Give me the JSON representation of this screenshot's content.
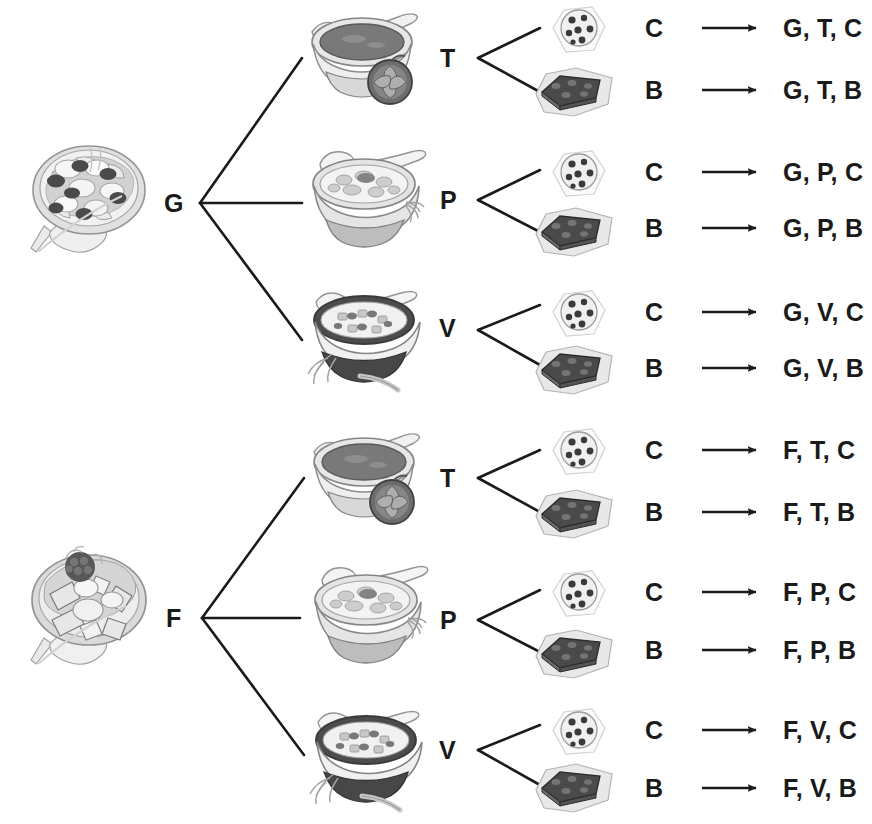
{
  "diagram": {
    "type": "tree-diagram",
    "levels": [
      "salad",
      "soup",
      "dessert",
      "outcome"
    ],
    "stage_width": 872,
    "stage_height": 824,
    "line_color": "#1a1a1a",
    "text_color": "#1a1a1a",
    "background": "#ffffff"
  },
  "legend": {
    "salad_codes": {
      "G": "Garden salad",
      "F": "Fruit salad"
    },
    "soup_codes": {
      "T": "Tomato soup",
      "P": "Potato soup",
      "V": "Vegetable soup"
    },
    "dessert_codes": {
      "C": "Cookie",
      "B": "Brownie"
    }
  },
  "branches": [
    {
      "root_label": "G",
      "root_image": "garden-salad-plate",
      "soups": [
        {
          "label": "T",
          "image": "tomato-soup-bowl",
          "desserts": [
            {
              "label": "C",
              "image": "cookie",
              "outcome": "G, T, C"
            },
            {
              "label": "B",
              "image": "brownie",
              "outcome": "G, T, B"
            }
          ]
        },
        {
          "label": "P",
          "image": "potato-soup-bowl",
          "desserts": [
            {
              "label": "C",
              "image": "cookie",
              "outcome": "G, P, C"
            },
            {
              "label": "B",
              "image": "brownie",
              "outcome": "G, P, B"
            }
          ]
        },
        {
          "label": "V",
          "image": "vegetable-soup-bowl",
          "desserts": [
            {
              "label": "C",
              "image": "cookie",
              "outcome": "G, V, C"
            },
            {
              "label": "B",
              "image": "brownie",
              "outcome": "G, V, B"
            }
          ]
        }
      ]
    },
    {
      "root_label": "F",
      "root_image": "fruit-salad-plate",
      "soups": [
        {
          "label": "T",
          "image": "tomato-soup-bowl",
          "desserts": [
            {
              "label": "C",
              "image": "cookie",
              "outcome": "F, T, C"
            },
            {
              "label": "B",
              "image": "brownie",
              "outcome": "F, T, B"
            }
          ]
        },
        {
          "label": "P",
          "image": "potato-soup-bowl",
          "desserts": [
            {
              "label": "C",
              "image": "cookie",
              "outcome": "F, P, C"
            },
            {
              "label": "B",
              "image": "brownie",
              "outcome": "F, P, B"
            }
          ]
        },
        {
          "label": "V",
          "image": "vegetable-soup-bowl",
          "desserts": [
            {
              "label": "C",
              "image": "cookie",
              "outcome": "F, V, C"
            },
            {
              "label": "B",
              "image": "brownie",
              "outcome": "F, V, B"
            }
          ]
        }
      ]
    }
  ],
  "outcomes_flat": [
    "G, T, C",
    "G, T, B",
    "G, P, C",
    "G, P, B",
    "G, V, C",
    "G, V, B",
    "F, T, C",
    "F, T, B",
    "F, P, C",
    "F, P, B",
    "F, V, C",
    "F, V, B"
  ],
  "total_outcomes": 12
}
